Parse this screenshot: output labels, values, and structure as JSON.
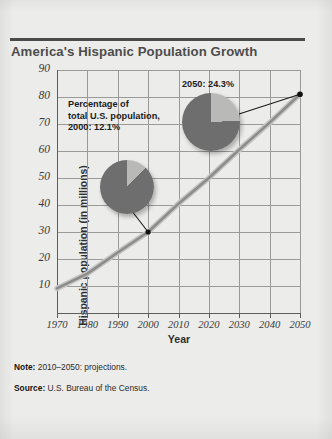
{
  "figure": {
    "title": "America's Hispanic Population Growth",
    "note_label": "Note:",
    "note_text": "2010–2050: projections.",
    "source_label": "Source:",
    "source_text": "U.S. Bureau of the Census."
  },
  "chart_data": {
    "type": "line",
    "title": "America's Hispanic Population Growth",
    "xlabel": "Year",
    "ylabel": "Hispanic population (in millions)",
    "x": [
      1970,
      1980,
      1990,
      2000,
      2010,
      2020,
      2030,
      2040,
      2050
    ],
    "values": [
      9.1,
      14.6,
      22.4,
      30.0,
      40.5,
      50.0,
      60.5,
      70.5,
      81.0
    ],
    "categories": [
      "1970",
      "1980",
      "1990",
      "2000",
      "2010",
      "2020",
      "2030",
      "2040",
      "2050"
    ],
    "xticklabels": [
      "1970",
      "1980",
      "1990",
      "2000",
      "2010",
      "2020",
      "2030",
      "2040",
      "2050"
    ],
    "yticklabels": [
      "10",
      "20",
      "30",
      "40",
      "50",
      "60",
      "70",
      "80",
      "90"
    ],
    "yticks": [
      10,
      20,
      30,
      40,
      50,
      60,
      70,
      80,
      90
    ],
    "xlim": [
      1970,
      2050
    ],
    "ylim": [
      0,
      90
    ],
    "grid": true,
    "legend": "none",
    "series_color": "#8c8c8c",
    "markers": [
      {
        "x": 2000,
        "y": 30.0,
        "label": "2000 marker"
      },
      {
        "x": 2050,
        "y": 81.0,
        "label": "2050 marker"
      }
    ],
    "annotations": [
      {
        "name": "pct-2000",
        "text": "Percentage of\ntotal U.S. population,\n2000:  12.1%",
        "pie": {
          "type": "pie",
          "values": [
            12.1,
            87.9
          ],
          "labels": [
            "Hispanic",
            "Other"
          ],
          "colors": [
            "#b9b9b7",
            "#6e6e6e"
          ]
        }
      },
      {
        "name": "pct-2050",
        "text": "2050: 24.3%",
        "pie": {
          "type": "pie",
          "values": [
            24.3,
            75.7
          ],
          "labels": [
            "Hispanic",
            "Other"
          ],
          "colors": [
            "#b9b9b7",
            "#6e6e6e"
          ]
        }
      }
    ]
  },
  "colors": {
    "paper": "#ececeb",
    "rule": "#4a4a4a",
    "title": "#4c4c4c",
    "grid": "#9a9a99",
    "axis": "#5d5d5c",
    "curve": "#8c8c8c",
    "pie_slice_light": "#b9b9b7",
    "pie_slice_dark": "#6e6e6e"
  }
}
